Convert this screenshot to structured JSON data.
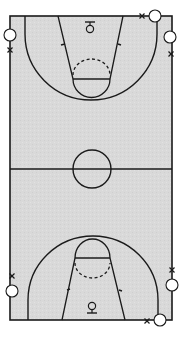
{
  "diagram": {
    "type": "basketball-court",
    "colors": {
      "background": "#ffffff",
      "court_fill": "#d9d9d9",
      "line": "#1a1a1a",
      "player_fill": "#ffffff"
    },
    "court": {
      "x": 10,
      "y": 16,
      "width": 162,
      "height": 304,
      "midline_y": 169
    },
    "center_circle": {
      "cx": 92,
      "cy": 169,
      "r": 19
    },
    "top_half": {
      "three_point_arc": {
        "left_x": 25,
        "right_x": 157,
        "apex_y": 99
      },
      "lane": {
        "top_left_x": 58,
        "top_right_x": 123,
        "bottom_left_x": 73,
        "bottom_right_x": 110,
        "ft_line_y": 79
      },
      "ft_circle": {
        "cx": 91,
        "cy": 79,
        "r": 19
      },
      "basket": {
        "cx": 90,
        "cy": 28
      }
    },
    "bottom_half": {
      "three_point_arc": {
        "left_x": 28,
        "right_x": 158,
        "apex_y": 236
      },
      "lane": {
        "bottom_left_x": 62,
        "bottom_right_x": 125,
        "top_left_x": 75,
        "top_right_x": 110,
        "ft_line_y": 258
      },
      "ft_circle": {
        "cx": 92,
        "cy": 258,
        "r": 19
      },
      "basket": {
        "cx": 92,
        "cy": 307
      }
    },
    "players": [
      {
        "id": "p1",
        "cx": 10,
        "cy": 35
      },
      {
        "id": "p2",
        "cx": 155,
        "cy": 16
      },
      {
        "id": "p3",
        "cx": 170,
        "cy": 37
      },
      {
        "id": "p4",
        "cx": 12,
        "cy": 291
      },
      {
        "id": "p5",
        "cx": 172,
        "cy": 285
      },
      {
        "id": "p6",
        "cx": 160,
        "cy": 320
      }
    ],
    "defenders_x_marks": [
      {
        "id": "x1",
        "x": 10,
        "y": 50
      },
      {
        "id": "x2",
        "x": 142,
        "y": 16
      },
      {
        "id": "x3",
        "x": 171,
        "y": 54
      },
      {
        "id": "x4",
        "x": 12,
        "y": 276
      },
      {
        "id": "x5",
        "x": 172,
        "y": 270
      },
      {
        "id": "x6",
        "x": 147,
        "y": 321
      }
    ]
  }
}
